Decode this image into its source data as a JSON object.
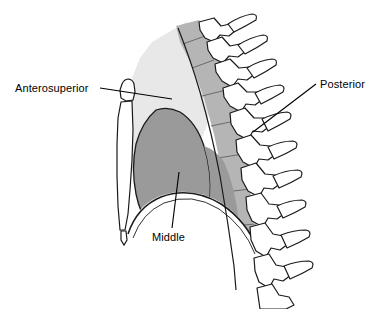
{
  "figure": {
    "width": 379,
    "height": 309,
    "background_color": "#ffffff"
  },
  "labels": [
    {
      "id": "anterosuperior",
      "text": "Anterosuperior",
      "leader": "horizontal line pointing right to the anterosuperior mediastinum wedge"
    },
    {
      "id": "posterior",
      "text": "Posterior",
      "leader": "diagonal line pointing down-left to the posterior mediastinum band"
    },
    {
      "id": "middle",
      "text": "Middle",
      "leader": "vertical line pointing up into the middle mediastinum region"
    }
  ],
  "regions": [
    {
      "id": "anterosuperior-region",
      "name": "anterosuperior-mediastinum",
      "fill": "#e8e8e8",
      "stroke": "#d2d2d2"
    },
    {
      "id": "middle-region",
      "name": "middle-mediastinum",
      "fill": "#9a9a9a",
      "stroke": "#1a1a1a"
    },
    {
      "id": "posterior-region",
      "name": "posterior-mediastinum",
      "fill": "#b5b5b5",
      "stroke": "#b0b0b0"
    }
  ],
  "structures": [
    {
      "id": "sternum",
      "name": "sternum",
      "fill": "#ffffff",
      "stroke": "#1a1a1a"
    },
    {
      "id": "manubrium",
      "name": "manubrium",
      "fill": "#ffffff",
      "stroke": "#1a1a1a"
    },
    {
      "id": "xiphoid",
      "name": "xiphoid-process",
      "fill": "#ffffff",
      "stroke": "#1a1a1a"
    },
    {
      "id": "vertebral-column",
      "name": "thoracic-vertebral-column",
      "fill": "#ffffff",
      "stroke": "#1a1a1a"
    },
    {
      "id": "diaphragm",
      "name": "diaphragm",
      "fill": "#ffffff",
      "stroke": "#1a1a1a"
    }
  ],
  "colors": {
    "outline": "#1a1a1a",
    "light_gray": "#e8e8e8",
    "mid_gray": "#b5b5b5",
    "dark_gray": "#9a9a9a",
    "white": "#ffffff",
    "text": "#000000"
  }
}
